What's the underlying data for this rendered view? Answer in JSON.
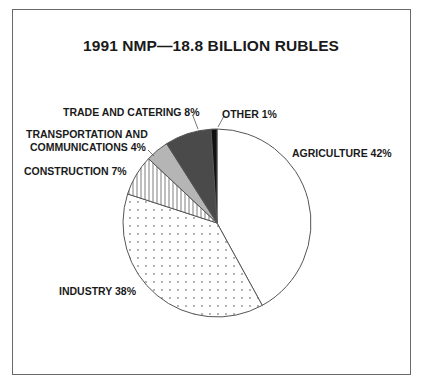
{
  "chart_data": {
    "type": "pie",
    "title": "1991 NMP—18.8 BILLION RUBLES",
    "start_angle": "12 o'clock",
    "direction": "clockwise",
    "slices": [
      {
        "label": "AGRICULTURE",
        "value": 42,
        "fill": "white"
      },
      {
        "label": "INDUSTRY",
        "value": 38,
        "fill": "dotted"
      },
      {
        "label": "CONSTRUCTION",
        "value": 7,
        "fill": "vertical-hatch"
      },
      {
        "label": "TRANSPORTATION AND COMMUNICATIONS",
        "value": 4,
        "fill": "#b5b5b5"
      },
      {
        "label": "TRADE AND CATERING",
        "value": 8,
        "fill": "#4a4a4a"
      },
      {
        "label": "OTHER",
        "value": 1,
        "fill": "#111111"
      }
    ],
    "labels_text": {
      "agriculture": "AGRICULTURE 42%",
      "industry": "INDUSTRY 38%",
      "construction": "CONSTRUCTION 7%",
      "transport_line1": "TRANSPORTATION AND",
      "transport_line2": "COMMUNICATIONS 4%",
      "trade": "TRADE AND CATERING 8%",
      "other": "OTHER 1%"
    },
    "unit": "%"
  }
}
